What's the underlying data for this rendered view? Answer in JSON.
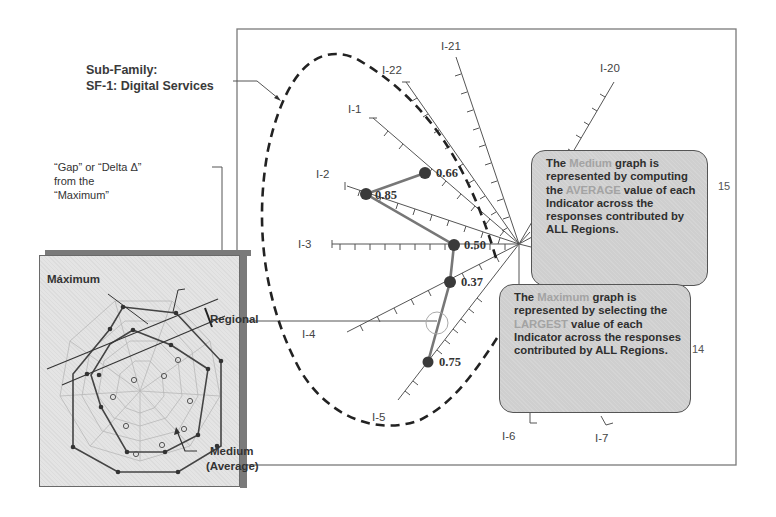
{
  "sub_family": {
    "line1": "Sub-Family:",
    "line2": "SF-1:  Digital Services"
  },
  "gap_note": {
    "line1": "“Gap” or “Delta  Δ”",
    "line2": "from the",
    "line3": "“Maximum”"
  },
  "inset": {
    "maximum_label": "Máximum",
    "regional_label": "Regional",
    "medium_label_line1": "Medium",
    "medium_label_line2": "(Average)"
  },
  "axes": {
    "i1": "I-1",
    "i2": "I-2",
    "i3": "I-3",
    "i4": "I-4",
    "i5": "I-5",
    "i6": "I-6",
    "i7": "I-7",
    "i20": "I-20",
    "i21": "I-21",
    "i22": "I-22"
  },
  "values": {
    "i1": "0.66",
    "i2": "0.85",
    "i3": "0.50",
    "i4": "0.37",
    "i5": "0.75"
  },
  "side_numbers": {
    "n15": "15",
    "n14": "14"
  },
  "callout_medium": {
    "p1": "The ",
    "hl1": "Medium",
    "p2": " graph is represented by computing the ",
    "hl2": "AVERAGE",
    "p3": " value of each Indicator across the responses contributed by ALL Regions."
  },
  "callout_max": {
    "p1": "The ",
    "hl1": "Maximum",
    "p2": " graph is represented by selecting the ",
    "hl2": "LARGEST",
    "p3": " value of each Indicator across the responses contributed by ALL Regions."
  },
  "colors": {
    "callout_bg": "#cfcfcf",
    "highlight_text": "#a3a3a3",
    "inset_bg": "#e4e4e4",
    "dashed_outline": "#222222"
  }
}
